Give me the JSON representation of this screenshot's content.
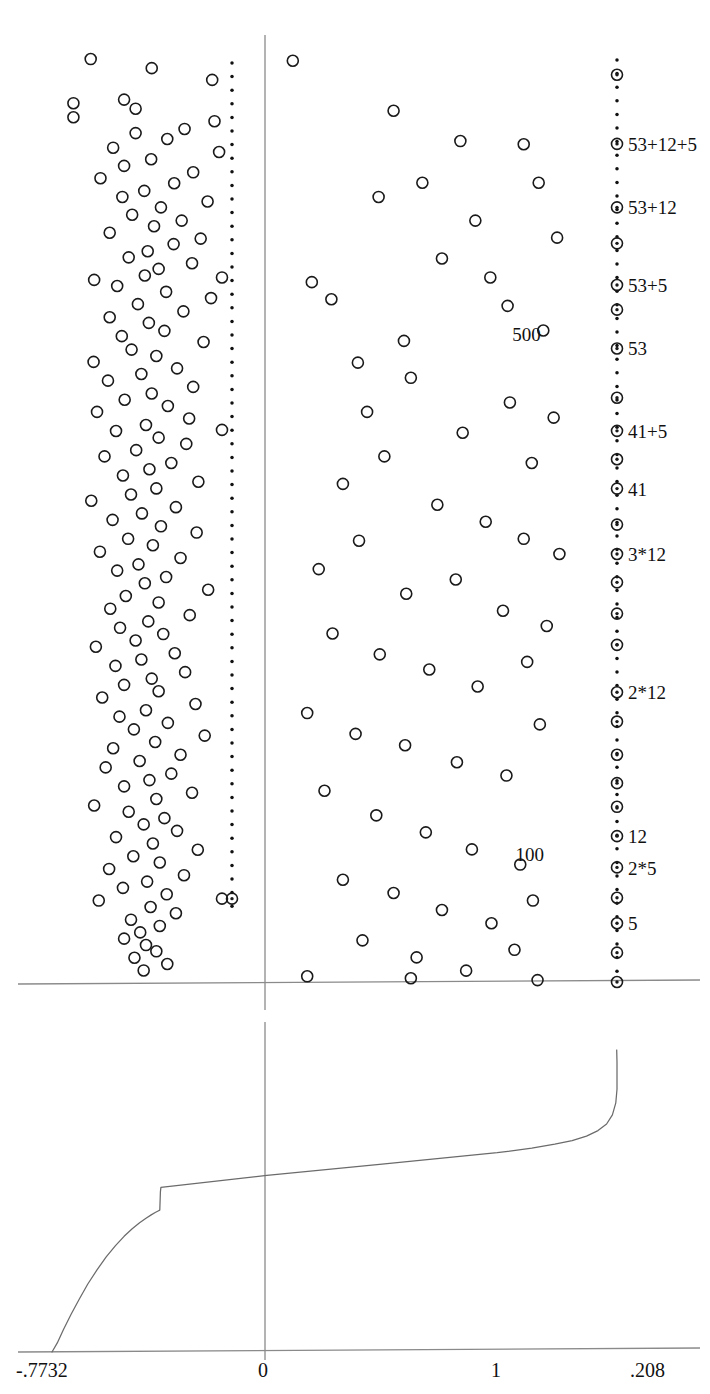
{
  "chart_data": {
    "type": "scatter",
    "title": "",
    "subtitle": "",
    "xlabel": "",
    "ylabel": "",
    "panels": [
      {
        "name": "scatter-panel",
        "note": "upper panel: open-circle scatter with vertical axis at x=0 and two vertical dotted reference lines",
        "xlim": [
          -0.7732,
          0.208
        ],
        "grid": false,
        "legend": "none",
        "vertical_axis_value": 0,
        "horizontal_axis_value": 0,
        "dotted_lines": [
          {
            "name": "left-dotted-line",
            "x_value": -0.478
          },
          {
            "name": "right-dotted-line",
            "x_value": 0.208
          }
        ],
        "inner_labels": [
          {
            "text": "500",
            "x_value": 0.012,
            "y_frac": 0.317
          },
          {
            "text": "100",
            "x_value": 0.018,
            "y_frac": 0.866
          }
        ],
        "right_axis_labels": [
          {
            "text": "53+12+5",
            "y_frac": 0.1153
          },
          {
            "text": "53+12",
            "y_frac": 0.1819
          },
          {
            "text": "53+5",
            "y_frac": 0.2638
          },
          {
            "text": "53",
            "y_frac": 0.3307
          },
          {
            "text": "41+5",
            "y_frac": 0.4177
          },
          {
            "text": "41",
            "y_frac": 0.4792
          },
          {
            "text": "3*12",
            "y_frac": 0.5482
          },
          {
            "text": "2*12",
            "y_frac": 0.694
          },
          {
            "text": "12",
            "y_frac": 0.8461
          },
          {
            "text": "2*5",
            "y_frac": 0.8794
          },
          {
            "text": "5",
            "y_frac": 0.938
          }
        ],
        "marked_points_right": [
          0.042,
          0.115,
          0.182,
          0.22,
          0.264,
          0.29,
          0.331,
          0.383,
          0.418,
          0.448,
          0.479,
          0.517,
          0.548,
          0.578,
          0.611,
          0.644,
          0.694,
          0.725,
          0.76,
          0.79,
          0.815,
          0.846,
          0.879,
          0.911,
          0.938,
          0.969
        ],
        "points": [
          [
            -0.706,
            0.0254
          ],
          [
            -0.6,
            0.035
          ],
          [
            -0.495,
            0.0474
          ],
          [
            -0.648,
            0.0682
          ],
          [
            -0.736,
            0.072
          ],
          [
            -0.628,
            0.0778
          ],
          [
            -0.736,
            0.0868
          ],
          [
            -0.491,
            0.091
          ],
          [
            -0.543,
            0.0992
          ],
          [
            -0.628,
            0.1036
          ],
          [
            -0.573,
            0.1098
          ],
          [
            -0.667,
            0.119
          ],
          [
            -0.483,
            0.1236
          ],
          [
            -0.601,
            0.1312
          ],
          [
            -0.648,
            0.1382
          ],
          [
            -0.528,
            0.145
          ],
          [
            -0.689,
            0.1512
          ],
          [
            -0.561,
            0.1566
          ],
          [
            -0.613,
            0.1646
          ],
          [
            -0.651,
            0.171
          ],
          [
            -0.503,
            0.1758
          ],
          [
            -0.584,
            0.182
          ],
          [
            -0.634,
            0.1898
          ],
          [
            -0.548,
            0.196
          ],
          [
            -0.596,
            0.202
          ],
          [
            -0.673,
            0.2088
          ],
          [
            -0.515,
            0.215
          ],
          [
            -0.562,
            0.2208
          ],
          [
            -0.607,
            0.2284
          ],
          [
            -0.64,
            0.2348
          ],
          [
            -0.53,
            0.241
          ],
          [
            -0.588,
            0.247
          ],
          [
            -0.612,
            0.254
          ],
          [
            -0.7,
            0.2586
          ],
          [
            -0.66,
            0.265
          ],
          [
            -0.575,
            0.2712
          ],
          [
            -0.497,
            0.2778
          ],
          [
            -0.624,
            0.2842
          ],
          [
            -0.545,
            0.2918
          ],
          [
            -0.673,
            0.298
          ],
          [
            -0.605,
            0.304
          ],
          [
            -0.578,
            0.3124
          ],
          [
            -0.652,
            0.318
          ],
          [
            -0.51,
            0.3242
          ],
          [
            -0.635,
            0.3322
          ],
          [
            -0.592,
            0.339
          ],
          [
            -0.701,
            0.3452
          ],
          [
            -0.556,
            0.352
          ],
          [
            -0.618,
            0.358
          ],
          [
            -0.676,
            0.365
          ],
          [
            -0.528,
            0.3716
          ],
          [
            -0.6,
            0.3786
          ],
          [
            -0.647,
            0.3852
          ],
          [
            -0.572,
            0.3918
          ],
          [
            -0.695,
            0.398
          ],
          [
            -0.535,
            0.405
          ],
          [
            -0.61,
            0.4118
          ],
          [
            -0.662,
            0.4182
          ],
          [
            -0.588,
            0.4252
          ],
          [
            -0.54,
            0.4318
          ],
          [
            -0.627,
            0.4384
          ],
          [
            -0.682,
            0.445
          ],
          [
            -0.566,
            0.452
          ],
          [
            -0.604,
            0.4586
          ],
          [
            -0.65,
            0.4652
          ],
          [
            -0.519,
            0.4718
          ],
          [
            -0.592,
            0.4788
          ],
          [
            -0.636,
            0.4852
          ],
          [
            -0.705,
            0.4918
          ],
          [
            -0.558,
            0.4986
          ],
          [
            -0.617,
            0.5052
          ],
          [
            -0.668,
            0.512
          ],
          [
            -0.584,
            0.5188
          ],
          [
            -0.522,
            0.5254
          ],
          [
            -0.641,
            0.532
          ],
          [
            -0.598,
            0.5388
          ],
          [
            -0.69,
            0.5456
          ],
          [
            -0.55,
            0.5522
          ],
          [
            -0.623,
            0.559
          ],
          [
            -0.66,
            0.5656
          ],
          [
            -0.575,
            0.5724
          ],
          [
            -0.612,
            0.579
          ],
          [
            -0.502,
            0.5858
          ],
          [
            -0.645,
            0.5924
          ],
          [
            -0.588,
            0.5992
          ],
          [
            -0.672,
            0.6058
          ],
          [
            -0.534,
            0.6126
          ],
          [
            -0.606,
            0.6192
          ],
          [
            -0.655,
            0.626
          ],
          [
            -0.58,
            0.6326
          ],
          [
            -0.628,
            0.6394
          ],
          [
            -0.697,
            0.646
          ],
          [
            -0.56,
            0.6528
          ],
          [
            -0.618,
            0.6594
          ],
          [
            -0.663,
            0.6662
          ],
          [
            -0.542,
            0.6728
          ],
          [
            -0.6,
            0.6796
          ],
          [
            -0.648,
            0.6862
          ],
          [
            -0.588,
            0.693
          ],
          [
            -0.686,
            0.6996
          ],
          [
            -0.524,
            0.7064
          ],
          [
            -0.61,
            0.713
          ],
          [
            -0.656,
            0.7198
          ],
          [
            -0.572,
            0.7264
          ],
          [
            -0.631,
            0.7332
          ],
          [
            -0.508,
            0.7398
          ],
          [
            -0.594,
            0.7466
          ],
          [
            -0.667,
            0.7532
          ],
          [
            -0.55,
            0.76
          ],
          [
            -0.621,
            0.7666
          ],
          [
            -0.68,
            0.7734
          ],
          [
            -0.566,
            0.78
          ],
          [
            -0.604,
            0.7868
          ],
          [
            -0.648,
            0.7934
          ],
          [
            -0.53,
            0.8002
          ],
          [
            -0.592,
            0.8068
          ],
          [
            -0.7,
            0.8136
          ],
          [
            -0.64,
            0.8202
          ],
          [
            -0.578,
            0.827
          ],
          [
            -0.614,
            0.8336
          ],
          [
            -0.556,
            0.8404
          ],
          [
            -0.662,
            0.847
          ],
          [
            -0.598,
            0.8538
          ],
          [
            -0.52,
            0.8604
          ],
          [
            -0.632,
            0.8672
          ],
          [
            -0.586,
            0.8738
          ],
          [
            -0.674,
            0.8806
          ],
          [
            -0.544,
            0.8872
          ],
          [
            -0.608,
            0.894
          ],
          [
            -0.65,
            0.9006
          ],
          [
            -0.574,
            0.9074
          ],
          [
            -0.692,
            0.914
          ],
          [
            -0.602,
            0.9208
          ],
          [
            -0.558,
            0.9274
          ],
          [
            -0.636,
            0.9342
          ],
          [
            -0.586,
            0.9408
          ],
          [
            -0.62,
            0.9476
          ],
          [
            -0.648,
            0.9542
          ],
          [
            -0.61,
            0.961
          ],
          [
            -0.592,
            0.9676
          ],
          [
            -0.63,
            0.9744
          ],
          [
            -0.573,
            0.981
          ],
          [
            -0.614,
            0.9878
          ],
          [
            -0.355,
            0.0272
          ],
          [
            -0.18,
            0.08
          ],
          [
            -0.206,
            0.171
          ],
          [
            -0.322,
            0.261
          ],
          [
            -0.288,
            0.279
          ],
          [
            -0.13,
            0.156
          ],
          [
            -0.064,
            0.112
          ],
          [
            -0.096,
            0.236
          ],
          [
            -0.162,
            0.323
          ],
          [
            -0.242,
            0.346
          ],
          [
            -0.038,
            0.196
          ],
          [
            -0.012,
            0.256
          ],
          [
            0.046,
            0.1154
          ],
          [
            0.072,
            0.156
          ],
          [
            0.104,
            0.214
          ],
          [
            0.018,
            0.286
          ],
          [
            0.08,
            0.312
          ],
          [
            -0.226,
            0.398
          ],
          [
            -0.15,
            0.362
          ],
          [
            -0.06,
            0.42
          ],
          [
            0.022,
            0.388
          ],
          [
            0.098,
            0.404
          ],
          [
            0.06,
            0.452
          ],
          [
            -0.268,
            0.474
          ],
          [
            -0.196,
            0.445
          ],
          [
            -0.104,
            0.496
          ],
          [
            -0.02,
            0.514
          ],
          [
            0.046,
            0.532
          ],
          [
            0.108,
            0.548
          ],
          [
            -0.31,
            0.564
          ],
          [
            -0.24,
            0.534
          ],
          [
            -0.158,
            0.59
          ],
          [
            -0.072,
            0.575
          ],
          [
            0.01,
            0.608
          ],
          [
            0.086,
            0.624
          ],
          [
            -0.286,
            0.632
          ],
          [
            -0.204,
            0.654
          ],
          [
            -0.118,
            0.67
          ],
          [
            -0.034,
            0.688
          ],
          [
            0.052,
            0.662
          ],
          [
            -0.33,
            0.716
          ],
          [
            -0.246,
            0.738
          ],
          [
            -0.16,
            0.75
          ],
          [
            -0.07,
            0.768
          ],
          [
            0.016,
            0.782
          ],
          [
            0.074,
            0.728
          ],
          [
            -0.3,
            0.798
          ],
          [
            -0.21,
            0.824
          ],
          [
            -0.124,
            0.842
          ],
          [
            -0.044,
            0.86
          ],
          [
            0.04,
            0.876
          ],
          [
            -0.268,
            0.892
          ],
          [
            -0.18,
            0.906
          ],
          [
            -0.096,
            0.924
          ],
          [
            -0.01,
            0.938
          ],
          [
            0.062,
            0.914
          ],
          [
            -0.234,
            0.956
          ],
          [
            -0.14,
            0.974
          ],
          [
            -0.054,
            0.988
          ],
          [
            0.03,
            0.966
          ],
          [
            -0.478,
            0.256
          ],
          [
            -0.478,
            0.417
          ],
          [
            -0.478,
            0.912
          ],
          [
            -0.33,
            0.994
          ],
          [
            -0.15,
            0.996
          ],
          [
            0.07,
            0.998
          ]
        ]
      },
      {
        "name": "curve-panel",
        "note": "lower panel: monotone increasing curve with a kink",
        "xlim": [
          -0.7732,
          0.208
        ],
        "grid": false,
        "legend": "none",
        "vertical_axis_value": 0,
        "curve": [
          [
            -0.7732,
            0.0
          ],
          [
            -0.764,
            0.03
          ],
          [
            -0.753,
            0.075
          ],
          [
            -0.74,
            0.125
          ],
          [
            -0.726,
            0.175
          ],
          [
            -0.711,
            0.225
          ],
          [
            -0.695,
            0.272
          ],
          [
            -0.679,
            0.315
          ],
          [
            -0.663,
            0.352
          ],
          [
            -0.648,
            0.383
          ],
          [
            -0.634,
            0.408
          ],
          [
            -0.621,
            0.428
          ],
          [
            -0.61,
            0.443
          ],
          [
            -0.601,
            0.454
          ],
          [
            -0.594,
            0.462
          ],
          [
            -0.589,
            0.467
          ],
          [
            -0.586,
            0.47
          ],
          [
            -0.585,
            0.53
          ],
          [
            -0.584,
            0.545
          ],
          [
            -0.4,
            0.585
          ],
          [
            -0.2,
            0.622
          ],
          [
            0.0,
            0.66
          ],
          [
            0.06,
            0.675
          ],
          [
            0.1,
            0.688
          ],
          [
            0.13,
            0.7
          ],
          [
            0.155,
            0.715
          ],
          [
            0.175,
            0.733
          ],
          [
            0.19,
            0.755
          ],
          [
            0.2,
            0.785
          ],
          [
            0.206,
            0.825
          ],
          [
            0.208,
            0.87
          ],
          [
            0.208,
            0.915
          ],
          [
            0.208,
            0.96
          ],
          [
            0.2075,
            1.0
          ]
        ],
        "x_ticks": [
          {
            "value": -0.7732,
            "label": "-.7732"
          },
          {
            "value": 0.0,
            "label": "0"
          },
          {
            "value": 0.0,
            "label": "1",
            "note": "positional tick at x=1 of normalized scale"
          },
          {
            "value": 0.208,
            "label": ".208"
          }
        ],
        "x_tick_labels": [
          "-.7732",
          "0",
          "1",
          ".208"
        ]
      }
    ],
    "colors": {
      "marker_stroke": "#1a1a1a",
      "axis_line": "#8a8a8a",
      "dotted_line": "#111111",
      "curve_line": "#6b6b6b",
      "text": "#111111",
      "background": "#ffffff"
    },
    "marker_style": {
      "open_circle_radius_px": 5.5,
      "stroke_width_px": 1.6,
      "bullseye_dot_radius_px": 1.7
    }
  }
}
